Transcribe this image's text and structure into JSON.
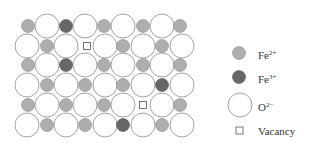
{
  "diagram": {
    "type": "crystal-lattice",
    "colors": {
      "fe2": "#aeaeae",
      "fe3": "#676767",
      "oxygen_fill": "#ffffff",
      "stroke": "#8a8a8a"
    },
    "rows": [
      {
        "y": 26,
        "sites": [
          [
            "s",
            28
          ],
          [
            "L",
            47
          ],
          [
            "d",
            66
          ],
          [
            "L",
            85
          ],
          [
            "s",
            104
          ],
          [
            "L",
            123
          ],
          [
            "s",
            143
          ],
          [
            "L",
            162
          ],
          [
            "s",
            180
          ]
        ]
      },
      {
        "y": 46,
        "sites": [
          [
            "L",
            27
          ],
          [
            "s",
            47
          ],
          [
            "L",
            66
          ],
          [
            "v",
            87
          ],
          [
            "L",
            105
          ],
          [
            "s",
            123
          ],
          [
            "L",
            143
          ],
          [
            "s",
            162
          ],
          [
            "L",
            182
          ]
        ]
      },
      {
        "y": 65,
        "sites": [
          [
            "s",
            28
          ],
          [
            "L",
            47
          ],
          [
            "d",
            66
          ],
          [
            "L",
            85
          ],
          [
            "s",
            104
          ],
          [
            "L",
            123
          ],
          [
            "s",
            143
          ],
          [
            "L",
            162
          ],
          [
            "s",
            180
          ]
        ]
      },
      {
        "y": 85,
        "sites": [
          [
            "L",
            27
          ],
          [
            "s",
            47
          ],
          [
            "L",
            66
          ],
          [
            "s",
            85
          ],
          [
            "L",
            105
          ],
          [
            "s",
            123
          ],
          [
            "L",
            143
          ],
          [
            "d",
            162
          ],
          [
            "L",
            182
          ]
        ]
      },
      {
        "y": 105,
        "sites": [
          [
            "s",
            28
          ],
          [
            "L",
            47
          ],
          [
            "s",
            66
          ],
          [
            "L",
            85
          ],
          [
            "s",
            104
          ],
          [
            "L",
            123
          ],
          [
            "v",
            143
          ],
          [
            "L",
            162
          ],
          [
            "s",
            180
          ]
        ]
      },
      {
        "y": 125,
        "sites": [
          [
            "L",
            27
          ],
          [
            "s",
            47
          ],
          [
            "L",
            66
          ],
          [
            "s",
            85
          ],
          [
            "L",
            105
          ],
          [
            "d",
            123
          ],
          [
            "L",
            143
          ],
          [
            "s",
            162
          ],
          [
            "L",
            182
          ]
        ]
      }
    ]
  },
  "legend": {
    "items": [
      {
        "key": "fe2",
        "base": "Fe",
        "charge": "2+"
      },
      {
        "key": "fe3",
        "base": "Fe",
        "charge": "3+"
      },
      {
        "key": "oxygen",
        "base": "O",
        "charge": "2−"
      },
      {
        "key": "vacancy",
        "label": "Vacancy"
      }
    ]
  }
}
